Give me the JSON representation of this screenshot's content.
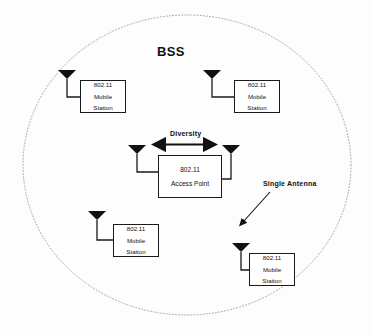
{
  "diagram": {
    "title": "BSS",
    "coverage_area": {
      "shape": "ellipse",
      "line_style": "dotted",
      "name": "bss-coverage-ellipse"
    },
    "access_point": {
      "label_line1": "802.11",
      "label_line2": "Access Point",
      "antennas": 2,
      "antenna_names": [
        "left-antenna",
        "right-antenna"
      ],
      "annotation": "Diversity"
    },
    "mobile_stations": [
      {
        "position": "top-left",
        "label_line1": "802.11",
        "label_line2": "Mobile",
        "label_line3": "Station",
        "antennas": 1
      },
      {
        "position": "top-right",
        "label_line1": "802.11",
        "label_line2": "Mobile",
        "label_line3": "Station",
        "antennas": 1
      },
      {
        "position": "bottom-left",
        "label_line1": "802.11",
        "label_line2": "Mobile",
        "label_line3": "Station",
        "antennas": 1
      },
      {
        "position": "bottom-right",
        "label_line1": "802.11",
        "label_line2": "Mobile",
        "label_line3": "Station",
        "antennas": 1
      }
    ],
    "annotations": [
      {
        "text": "Diversity",
        "target": "access-point-antenna-pair",
        "arrow": "double-headed"
      },
      {
        "text": "Single Antenna",
        "target": "bottom-right-station-antenna",
        "arrow": "single-headed"
      }
    ],
    "colors": {
      "ink": "#111111",
      "line": "#1a1a1a",
      "ellipse": "#9a9a9a",
      "background": "#fdfdfd"
    }
  }
}
